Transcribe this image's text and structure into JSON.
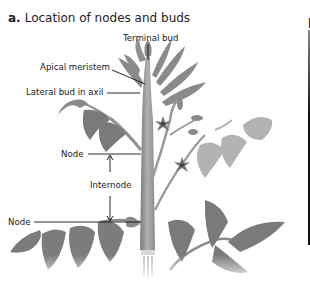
{
  "figure": {
    "panel_letter": "a.",
    "title": "Location of nodes and buds",
    "labels": {
      "terminal_bud": "Terminal bud",
      "apical_meristem": "Apical meristem",
      "lateral_bud": "Lateral bud in axil",
      "node_upper": "Node",
      "internode": "Internode",
      "node_lower": "Node"
    },
    "next_panel_letter": "b"
  },
  "colors": {
    "stem": "#9a9a9a",
    "leaf": "#7d7d7d",
    "leaf_light": "#b5b5b5",
    "text": "#222222"
  }
}
